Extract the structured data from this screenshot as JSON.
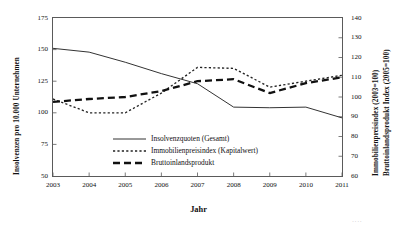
{
  "chart_data": {
    "type": "line",
    "title": "",
    "xlabel": "Jahr",
    "ylabel": "Insolvenzen pro 10.000 Unternehmen",
    "ylabel_right_1": "Immobilienpreisindex (2003=100)",
    "ylabel_right_2": "Bruttoinlandsprodukt Index (2005=100)",
    "x": [
      2003,
      2004,
      2005,
      2006,
      2007,
      2008,
      2009,
      2010,
      2011
    ],
    "categories": [
      "2003",
      "2004",
      "2005",
      "2006",
      "2007",
      "2008",
      "2009",
      "2010",
      "2011"
    ],
    "ylim": [
      50,
      175
    ],
    "yticks": [
      50,
      75,
      100,
      125,
      150,
      175
    ],
    "ytick_labels": [
      "50",
      "75",
      "100",
      "125",
      "150",
      "175"
    ],
    "ylim_right": [
      60,
      140
    ],
    "yticks_right": [
      60,
      70,
      80,
      90,
      100,
      110,
      120,
      130,
      140
    ],
    "ytick_labels_right": [
      "60",
      "70",
      "80",
      "90",
      "100",
      "110",
      "120",
      "130",
      "140"
    ],
    "grid": false,
    "legend_position": "center-left",
    "series": [
      {
        "name": "Insolvenzquoten (Gesamt)",
        "axis": "left",
        "style": "solid",
        "color": "#333333",
        "values": [
          151,
          148,
          140,
          131,
          123,
          104.5,
          104,
          104.5,
          96
        ]
      },
      {
        "name": "Immobilienpreisindex (Kapitalwert)",
        "axis": "right",
        "style": "dotted",
        "color": "#222222",
        "values": [
          99,
          92,
          92,
          102,
          115,
          114.5,
          105,
          108,
          111
        ]
      },
      {
        "name": "Bruttoinlandsprodukt",
        "axis": "right",
        "style": "dashed",
        "color": "#111111",
        "values": [
          97.5,
          99,
          100,
          103,
          108,
          109,
          102,
          107,
          110
        ]
      }
    ]
  },
  "legend": {
    "items": [
      {
        "label": "Insolvenzquoten (Gesamt)",
        "style": "solid"
      },
      {
        "label": "Immobilienpreisindex (Kapitalwert)",
        "style": "dotted"
      },
      {
        "label": "Bruttoinlandsprodukt",
        "style": "dashed"
      }
    ]
  },
  "artifact": {
    "text": "····"
  }
}
